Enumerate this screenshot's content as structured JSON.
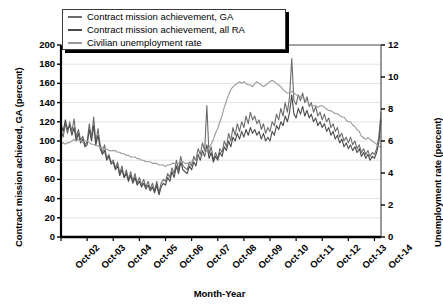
{
  "chart_data": {
    "type": "line",
    "title": "",
    "xlabel": "Month-Year",
    "ylabel": "Contract mission achieved, GA (percent)",
    "ylabel_right": "Unemployment rate (percent)",
    "ylim": [
      0,
      200
    ],
    "ylim_right": [
      0,
      12
    ],
    "yticks": [
      "200",
      "180",
      "160",
      "140",
      "120",
      "100",
      "80",
      "60",
      "40",
      "20",
      "0"
    ],
    "yticks_right": [
      "12",
      "10",
      "8",
      "6",
      "4",
      "2",
      "0"
    ],
    "grid": "horizontal",
    "legend_position": "top-left",
    "xticks": [
      "Oct-02",
      "Oct-03",
      "Oct-04",
      "Oct-05",
      "Oct-06",
      "Oct-07",
      "Oct-08",
      "Oct-09",
      "Oct-10",
      "Oct-11",
      "Oct-12",
      "Oct-13",
      "Oct-14"
    ],
    "x": [
      0,
      0.083,
      0.167,
      0.25,
      0.333,
      0.417,
      0.5,
      0.583,
      0.667,
      0.75,
      0.833,
      0.917,
      1,
      1.083,
      1.167,
      1.25,
      1.333,
      1.417,
      1.5,
      1.583,
      1.667,
      1.75,
      1.833,
      1.917,
      2,
      2.083,
      2.167,
      2.25,
      2.333,
      2.417,
      2.5,
      2.583,
      2.667,
      2.75,
      2.833,
      2.917,
      3,
      3.083,
      3.167,
      3.25,
      3.333,
      3.417,
      3.5,
      3.583,
      3.667,
      3.75,
      3.833,
      3.917,
      4,
      4.083,
      4.167,
      4.25,
      4.333,
      4.417,
      4.5,
      4.583,
      4.667,
      4.75,
      4.833,
      4.917,
      5,
      5.083,
      5.167,
      5.25,
      5.333,
      5.417,
      5.5,
      5.583,
      5.667,
      5.75,
      5.833,
      5.917,
      6,
      6.083,
      6.167,
      6.25,
      6.333,
      6.417,
      6.5,
      6.583,
      6.667,
      6.75,
      6.833,
      6.917,
      7,
      7.083,
      7.167,
      7.25,
      7.333,
      7.417,
      7.5,
      7.583,
      7.667,
      7.75,
      7.833,
      7.917,
      8,
      8.083,
      8.167,
      8.25,
      8.333,
      8.417,
      8.5,
      8.583,
      8.667,
      8.75,
      8.833,
      8.917,
      9,
      9.083,
      9.167,
      9.25,
      9.333,
      9.417,
      9.5,
      9.583,
      9.667,
      9.75,
      9.833,
      9.917,
      10,
      10.083,
      10.167,
      10.25,
      10.333,
      10.417,
      10.5,
      10.583,
      10.667,
      10.75,
      10.833,
      10.917,
      11,
      11.083,
      11.167,
      11.25,
      11.333,
      11.417,
      11.5,
      11.583,
      11.667,
      11.75,
      11.833,
      11.917,
      12,
      12.083,
      12.167,
      12.25
    ],
    "series": [
      {
        "name": "Contract mission achievement, GA",
        "color": "#6b6b6b",
        "axis": "left",
        "values": [
          112,
          104,
          118,
          108,
          120,
          110,
          123,
          104,
          112,
          101,
          105,
          96,
          99,
          118,
          103,
          125,
          98,
          113,
          96,
          88,
          96,
          82,
          86,
          78,
          80,
          72,
          78,
          66,
          74,
          62,
          70,
          60,
          68,
          58,
          66,
          56,
          62,
          54,
          60,
          52,
          58,
          50,
          56,
          48,
          58,
          46,
          56,
          60,
          58,
          66,
          62,
          72,
          66,
          80,
          70,
          84,
          74,
          72,
          70,
          78,
          74,
          84,
          80,
          92,
          86,
          98,
          90,
          137,
          86,
          94,
          80,
          88,
          82,
          92,
          88,
          100,
          94,
          108,
          100,
          114,
          106,
          118,
          110,
          120,
          114,
          126,
          118,
          130,
          122,
          126,
          118,
          122,
          112,
          118,
          108,
          114,
          110,
          120,
          116,
          128,
          122,
          134,
          126,
          140,
          130,
          146,
          186,
          142,
          138,
          148,
          142,
          150,
          140,
          146,
          136,
          140,
          130,
          136,
          126,
          130,
          122,
          128,
          120,
          124,
          114,
          118,
          110,
          114,
          104,
          108,
          100,
          104,
          98,
          104,
          96,
          100,
          92,
          96,
          88,
          92,
          86,
          90,
          84,
          88,
          86,
          92,
          104,
          130
        ]
      },
      {
        "name": "Contract mission achievement, all RA",
        "color": "#4a4a4a",
        "axis": "left",
        "values": [
          118,
          110,
          122,
          112,
          116,
          106,
          114,
          100,
          108,
          98,
          102,
          94,
          96,
          112,
          100,
          116,
          96,
          106,
          92,
          86,
          90,
          80,
          84,
          76,
          78,
          70,
          74,
          64,
          70,
          62,
          66,
          58,
          64,
          56,
          62,
          54,
          58,
          52,
          56,
          50,
          54,
          48,
          52,
          46,
          54,
          44,
          52,
          56,
          54,
          62,
          58,
          68,
          62,
          74,
          66,
          78,
          70,
          68,
          66,
          74,
          70,
          78,
          74,
          86,
          80,
          90,
          84,
          96,
          82,
          88,
          78,
          84,
          80,
          88,
          84,
          94,
          90,
          100,
          94,
          104,
          100,
          108,
          102,
          110,
          104,
          112,
          106,
          114,
          108,
          112,
          106,
          110,
          102,
          108,
          100,
          104,
          100,
          110,
          106,
          116,
          112,
          120,
          116,
          126,
          120,
          130,
          148,
          128,
          124,
          134,
          128,
          136,
          126,
          132,
          124,
          128,
          120,
          124,
          116,
          120,
          114,
          118,
          110,
          114,
          106,
          110,
          102,
          106,
          98,
          102,
          94,
          98,
          92,
          96,
          90,
          94,
          88,
          92,
          84,
          88,
          82,
          86,
          80,
          84,
          82,
          88,
          98,
          122
        ]
      },
      {
        "name": "Civilian unemployment rate",
        "color": "#9a9a9a",
        "axis": "right",
        "values_right": [
          5.8,
          5.9,
          5.8,
          5.9,
          5.9,
          6.0,
          6.1,
          6.0,
          6.1,
          6.0,
          5.9,
          6.0,
          6.0,
          5.9,
          5.8,
          5.8,
          5.7,
          5.7,
          5.6,
          5.6,
          5.5,
          5.5,
          5.4,
          5.4,
          5.4,
          5.4,
          5.3,
          5.3,
          5.2,
          5.2,
          5.1,
          5.1,
          5.0,
          5.0,
          5.0,
          4.9,
          4.9,
          4.8,
          4.8,
          4.7,
          4.7,
          4.7,
          4.6,
          4.6,
          4.6,
          4.5,
          4.5,
          4.5,
          4.4,
          4.5,
          4.5,
          4.6,
          4.6,
          4.6,
          4.6,
          4.7,
          4.7,
          4.6,
          4.6,
          4.6,
          4.7,
          4.8,
          4.9,
          5.0,
          5.0,
          5.1,
          5.2,
          5.4,
          5.6,
          5.8,
          6.1,
          6.5,
          6.8,
          7.2,
          7.6,
          8.1,
          8.5,
          8.9,
          9.2,
          9.4,
          9.5,
          9.6,
          9.7,
          9.6,
          9.7,
          9.6,
          9.5,
          9.5,
          9.4,
          9.6,
          9.7,
          9.6,
          9.5,
          9.4,
          9.5,
          9.6,
          9.7,
          9.8,
          9.7,
          9.6,
          9.5,
          9.4,
          9.2,
          9.1,
          9.0,
          9.0,
          9.1,
          9.0,
          8.9,
          8.8,
          8.8,
          8.7,
          8.6,
          8.5,
          8.3,
          8.2,
          8.2,
          8.2,
          8.1,
          8.2,
          8.2,
          8.1,
          8.0,
          7.9,
          7.9,
          7.8,
          7.7,
          7.7,
          7.6,
          7.5,
          7.5,
          7.3,
          7.2,
          7.2,
          7.0,
          6.9,
          6.7,
          6.6,
          6.3,
          6.2,
          6.1,
          6.2,
          6.1,
          6.0,
          5.9,
          5.8,
          5.7,
          5.6
        ]
      }
    ]
  },
  "legend": {
    "items": [
      {
        "label": "Contract mission achievement, GA",
        "color": "#6b6b6b"
      },
      {
        "label": "Contract mission achievement, all RA",
        "color": "#4a4a4a"
      },
      {
        "label": "Civilian unemployment rate",
        "color": "#9a9a9a"
      }
    ]
  }
}
